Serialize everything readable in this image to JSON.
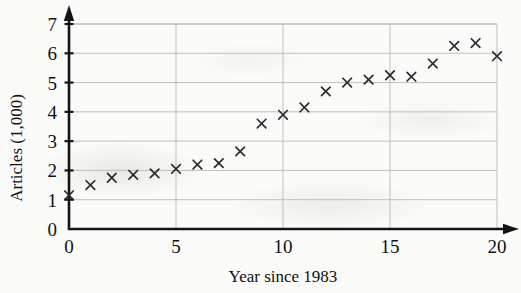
{
  "chart_data": {
    "type": "scatter",
    "title": "",
    "xlabel": "Year since 1983",
    "ylabel": "Articles (1,000)",
    "xlim": [
      0,
      20
    ],
    "ylim": [
      0,
      7
    ],
    "xticks": [
      0,
      5,
      10,
      15,
      20
    ],
    "yticks": [
      0,
      1,
      2,
      3,
      4,
      5,
      6,
      7
    ],
    "xtick_labels": [
      "0",
      "5",
      "10",
      "15",
      "20"
    ],
    "ytick_labels": [
      "0",
      "1",
      "2",
      "3",
      "4",
      "5",
      "6",
      "7"
    ],
    "grid": true,
    "grid_color": "#b9b8b4",
    "marker": "x",
    "marker_color": "#2b2b2b",
    "legend": "none",
    "x": [
      0,
      1,
      2,
      3,
      4,
      5,
      6,
      7,
      8,
      9,
      10,
      11,
      12,
      13,
      14,
      15,
      16,
      17,
      18,
      19,
      20
    ],
    "values": [
      1.15,
      1.5,
      1.75,
      1.85,
      1.9,
      2.05,
      2.2,
      2.25,
      2.65,
      3.6,
      3.9,
      4.15,
      4.7,
      5.0,
      5.1,
      5.25,
      5.2,
      5.65,
      6.25,
      6.35,
      5.9
    ],
    "series": [
      {
        "name": "Articles",
        "values": [
          1.15,
          1.5,
          1.75,
          1.85,
          1.9,
          2.05,
          2.2,
          2.25,
          2.65,
          3.6,
          3.9,
          4.15,
          4.7,
          5.0,
          5.1,
          5.25,
          5.2,
          5.65,
          6.25,
          6.35,
          5.9
        ]
      }
    ]
  },
  "axes": {
    "x_title": "Year since 1983",
    "y_title": "Articles (1,000)"
  }
}
